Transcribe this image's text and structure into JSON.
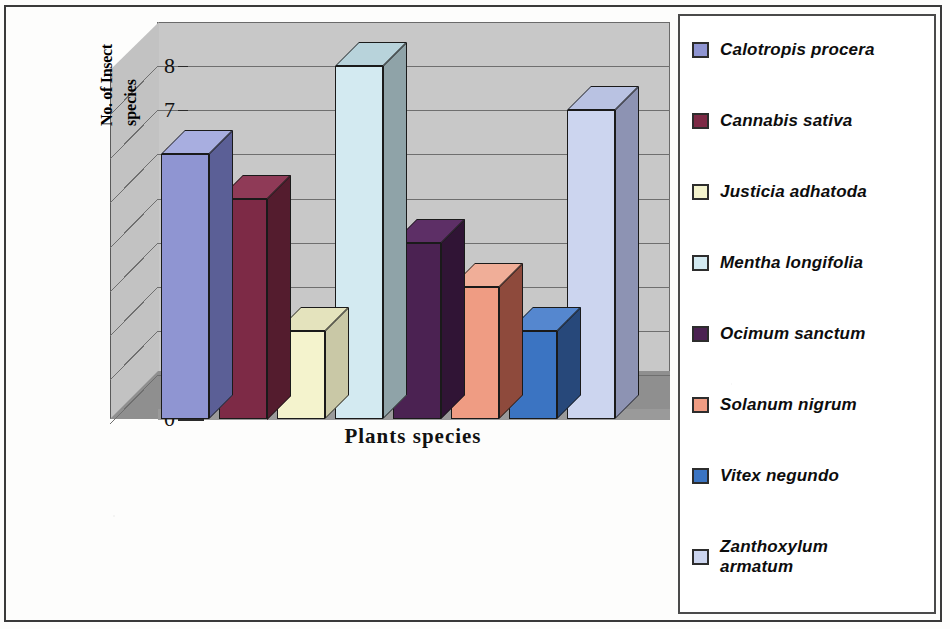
{
  "chart_data": {
    "type": "bar",
    "title": "",
    "xlabel": "Plants species",
    "ylabel_line1": "No. of Insect",
    "ylabel_line2": "species",
    "ylabel": "No. of Insect species",
    "categories": [
      "Calotropis procera",
      "Cannabis sativa",
      "Justicia adhatoda",
      "Mentha longifolia",
      "Ocimum sanctum",
      "Solanum nigrum",
      "Vitex negundo",
      "Zanthoxylum armatum"
    ],
    "values": [
      6,
      5,
      2,
      8,
      4,
      3,
      2,
      7
    ],
    "ylim": [
      0,
      8
    ],
    "yticks": [
      "0",
      "1",
      "2",
      "3",
      "4",
      "5",
      "6",
      "7",
      "8"
    ],
    "ytick_values": [
      0,
      1,
      2,
      3,
      4,
      5,
      6,
      7,
      8
    ],
    "grid": true,
    "legend_position": "right",
    "style": "3d-column",
    "colors": [
      "#8f95d2",
      "#7d2a46",
      "#f4f3cd",
      "#d3eaf1",
      "#4b2252",
      "#ef9c83",
      "#3b74c2",
      "#ccd5ef"
    ],
    "side_colors": [
      "#5b5f96",
      "#541c2e",
      "#c9c8a6",
      "#8fa3a8",
      "#301435",
      "#8e4a3c",
      "#27487a",
      "#8d93b3"
    ],
    "top_colors": [
      "#a8aee0",
      "#8f3a57",
      "#e4e3bd",
      "#b8d3db",
      "#5d2f66",
      "#f0ae98",
      "#5587cf",
      "#b9c2e2"
    ]
  },
  "legend": {
    "items": [
      {
        "label": "Calotropis procera",
        "label2": "",
        "color": "#8f95d2"
      },
      {
        "label": "Cannabis sativa",
        "label2": "",
        "color": "#7d2a46"
      },
      {
        "label": "Justicia adhatoda",
        "label2": "",
        "color": "#f4f3cd"
      },
      {
        "label": "Mentha longifolia",
        "label2": "",
        "color": "#d3eaf1"
      },
      {
        "label": "Ocimum sanctum",
        "label2": "",
        "color": "#4b2252"
      },
      {
        "label": "Solanum nigrum",
        "label2": "",
        "color": "#ef9c83"
      },
      {
        "label": "Vitex negundo",
        "label2": "",
        "color": "#3b74c2"
      },
      {
        "label": "Zanthoxylum",
        "label2": "armatum",
        "color": "#ccd5ef"
      }
    ]
  }
}
